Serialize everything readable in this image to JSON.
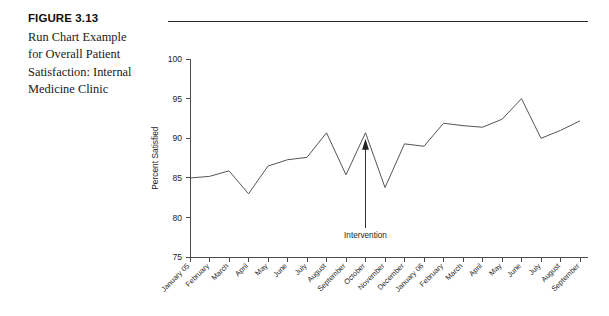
{
  "figure": {
    "number_label": "FIGURE 3.13",
    "caption": "Run Chart Example for Overall Patient Satisfaction: Internal Medicine Clinic"
  },
  "chart_data": {
    "type": "line",
    "title": "",
    "xlabel": "",
    "ylabel": "Percent Satisfied",
    "ylim": [
      75,
      100
    ],
    "yticks": [
      75,
      80,
      85,
      90,
      95,
      100
    ],
    "grid": false,
    "legend": "none",
    "categories": [
      "January 05",
      "February",
      "March",
      "April",
      "May",
      "June",
      "July",
      "August",
      "September",
      "October",
      "November",
      "December",
      "January 06",
      "February",
      "March",
      "April",
      "May",
      "June",
      "July",
      "August",
      "September"
    ],
    "values": [
      85.0,
      85.2,
      85.9,
      83.0,
      86.5,
      87.3,
      87.6,
      90.7,
      85.4,
      90.7,
      83.8,
      89.3,
      89.0,
      91.9,
      91.6,
      91.4,
      92.4,
      95.0,
      90.0,
      91.0,
      92.2
    ],
    "annotations": [
      {
        "label": "Intervention",
        "points_to_category": "October",
        "points_to_value": 90.7
      }
    ],
    "series_color": "#555555",
    "axis_color": "#4a4a4a"
  }
}
